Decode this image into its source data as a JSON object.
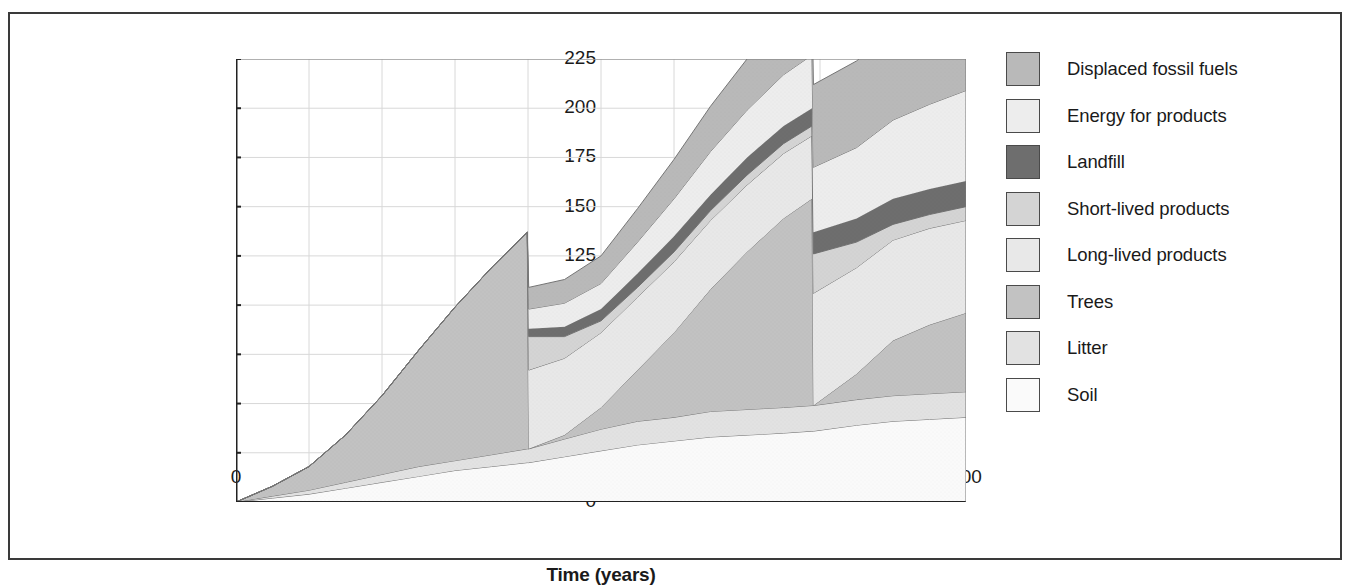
{
  "chart_data": {
    "type": "area",
    "title": "",
    "xlabel": "Time (years)",
    "ylabel": "Cumulative carbon (tC/ha)",
    "xlim": [
      0,
      100
    ],
    "ylim": [
      0,
      225
    ],
    "xticks": [
      0,
      10,
      20,
      30,
      40,
      50,
      60,
      70,
      80,
      90,
      100
    ],
    "yticks": [
      0,
      25,
      50,
      75,
      100,
      125,
      150,
      175,
      200,
      225
    ],
    "grid": true,
    "legend_position": "right",
    "stacked": true,
    "stack_order_bottom_to_top": [
      "Soil",
      "Litter",
      "Trees",
      "Long-lived products",
      "Short-lived products",
      "Landfill",
      "Energy for products",
      "Displaced fossil fuels"
    ],
    "colors": {
      "Displaced fossil fuels": "#b9b9b9",
      "Energy for products": "#ededed",
      "Landfill": "#6e6e6e",
      "Short-lived products": "#d4d4d4",
      "Long-lived products": "#e8e8e8",
      "Trees": "#c2c2c2",
      "Litter": "#e2e2e2",
      "Soil": "#fafafa"
    },
    "x": [
      0,
      5,
      10,
      15,
      20,
      25,
      30,
      35,
      39.9,
      40.1,
      45,
      50,
      55,
      60,
      65,
      70,
      75,
      78.9,
      79.1,
      85,
      90,
      95,
      100
    ],
    "series": [
      {
        "name": "Soil",
        "values": [
          0,
          2,
          4,
          7,
          10,
          13,
          16,
          18,
          20,
          20,
          23,
          26,
          29,
          31,
          33,
          34,
          35,
          36,
          36,
          39,
          41,
          42,
          43
        ]
      },
      {
        "name": "Litter",
        "values": [
          0,
          1,
          2,
          3,
          4,
          5,
          5,
          6,
          7,
          7,
          9,
          11,
          12,
          12,
          13,
          13,
          13,
          13,
          13,
          13,
          13,
          13,
          13
        ]
      },
      {
        "name": "Trees",
        "values": [
          0,
          5,
          12,
          24,
          40,
          59,
          78,
          95,
          110,
          0,
          2,
          11,
          26,
          43,
          62,
          80,
          96,
          105,
          0,
          13,
          28,
          35,
          40
        ]
      },
      {
        "name": "Long-lived products",
        "values": [
          0,
          0,
          0,
          0,
          0,
          0,
          0,
          0,
          0,
          40,
          39,
          38,
          37,
          36,
          35,
          34,
          33,
          32,
          57,
          54,
          51,
          49,
          47
        ]
      },
      {
        "name": "Short-lived products",
        "values": [
          0,
          0,
          0,
          0,
          0,
          0,
          0,
          0,
          0,
          17,
          11,
          6,
          5,
          5,
          5,
          5,
          5,
          5,
          20,
          13,
          8,
          7,
          7
        ]
      },
      {
        "name": "Landfill",
        "values": [
          0,
          0,
          0,
          0,
          0,
          0,
          0,
          0,
          0,
          4,
          5,
          6,
          7,
          8,
          8,
          9,
          9,
          9,
          11,
          12,
          13,
          13,
          13
        ]
      },
      {
        "name": "Energy for products",
        "values": [
          0,
          0,
          0,
          0,
          0,
          0,
          0,
          0,
          0,
          10,
          12,
          13,
          16,
          19,
          22,
          24,
          26,
          27,
          33,
          36,
          40,
          43,
          46
        ]
      },
      {
        "name": "Displaced fossil fuels",
        "values": [
          0,
          0,
          0,
          0,
          0,
          0,
          0,
          0,
          0,
          11,
          12,
          14,
          17,
          20,
          23,
          26,
          28,
          29,
          42,
          44,
          45,
          46,
          47
        ]
      }
    ]
  },
  "axes": {
    "ylabel": "Cumulative carbon (tC/ha)",
    "xlabel": "Time (years)",
    "yticks": [
      "0",
      "25",
      "50",
      "75",
      "100",
      "125",
      "150",
      "175",
      "200",
      "225"
    ],
    "xticks": [
      "0",
      "10",
      "20",
      "30",
      "40",
      "50",
      "60",
      "70",
      "80",
      "90",
      "100"
    ]
  },
  "legend": {
    "items": [
      {
        "label": "Displaced fossil fuels",
        "color": "#b9b9b9"
      },
      {
        "label": "Energy for products",
        "color": "#ededed"
      },
      {
        "label": "Landfill",
        "color": "#6e6e6e"
      },
      {
        "label": "Short-lived products",
        "color": "#d4d4d4"
      },
      {
        "label": "Long-lived products",
        "color": "#e8e8e8"
      },
      {
        "label": "Trees",
        "color": "#c2c2c2"
      },
      {
        "label": "Litter",
        "color": "#e2e2e2"
      },
      {
        "label": "Soil",
        "color": "#fafafa"
      }
    ]
  }
}
